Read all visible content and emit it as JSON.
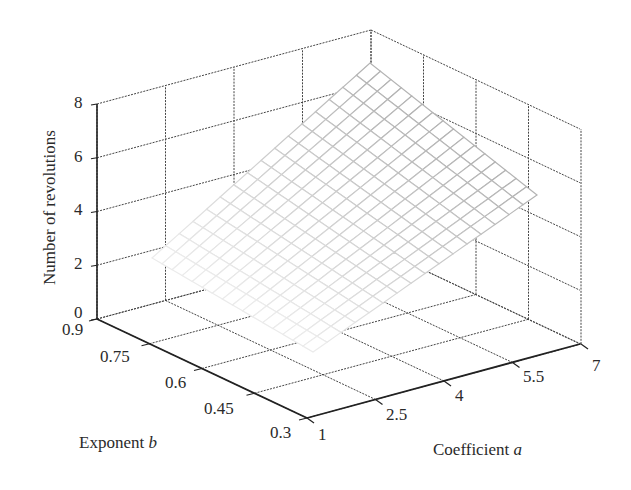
{
  "chart_data": {
    "type": "surface3d",
    "title": "",
    "xlabel": "Coefficient a",
    "ylabel": "Exponent b",
    "zlabel": "Number of revolutions",
    "x_ticks": [
      "1",
      "2.5",
      "4",
      "5.5",
      "7"
    ],
    "y_ticks": [
      "0.9",
      "0.75",
      "0.6",
      "0.45",
      "0.3"
    ],
    "z_ticks": [
      "0",
      "2",
      "4",
      "6",
      "8"
    ],
    "xlim": [
      1,
      7
    ],
    "ylim": [
      0.3,
      0.9
    ],
    "zlim": [
      0,
      8
    ],
    "grid": true,
    "surface_corners": {
      "a1_b0.3": 2.4,
      "a1_b0.9": 2.3,
      "a7_b0.3": 5.5,
      "a7_b0.9": 6.8
    },
    "mesh_resolution": 16,
    "surface_color": "#aaaaaa"
  },
  "axes": {
    "z_label": "Number of revolutions",
    "b_label_text": "Exponent ",
    "b_label_var": "b",
    "a_label_text": "Coefficient ",
    "a_label_var": "a"
  }
}
